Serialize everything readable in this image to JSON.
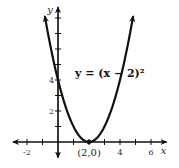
{
  "chart_data": {
    "type": "line",
    "title": "",
    "xlabel": "x",
    "ylabel": "y",
    "xlim": [
      -2.9,
      7.0
    ],
    "ylim": [
      -1.0,
      8.7
    ],
    "x_ticks": [
      -2,
      -1,
      0,
      1,
      2,
      3,
      4,
      5,
      6
    ],
    "y_ticks": [
      1,
      2,
      3,
      4,
      5,
      6,
      7,
      8
    ],
    "x_tick_labels": [
      {
        "value": -2,
        "label": "-2"
      },
      {
        "value": 4,
        "label": "4"
      },
      {
        "value": 6,
        "label": "6"
      }
    ],
    "y_tick_labels": [
      {
        "value": 2,
        "label": "2"
      },
      {
        "value": 4,
        "label": "4"
      }
    ],
    "grid": false,
    "series": [
      {
        "name": "y = (x-2)^2",
        "function": "(x-2)^2",
        "x_range": [
          -0.85,
          4.85
        ],
        "x": [
          -0.85,
          -0.5,
          0,
          0.5,
          1,
          1.5,
          2,
          2.5,
          3,
          3.5,
          4,
          4.5,
          4.85
        ],
        "y": [
          8.12,
          6.25,
          4,
          2.25,
          1,
          0.25,
          0,
          0.25,
          1,
          2.25,
          4,
          6.25,
          8.12
        ]
      }
    ],
    "annotations": [
      {
        "text": "y = (x − 2)²",
        "at": [
          1.1,
          4.2
        ]
      },
      {
        "text": "(2,0)",
        "point": [
          2,
          0
        ]
      }
    ]
  }
}
